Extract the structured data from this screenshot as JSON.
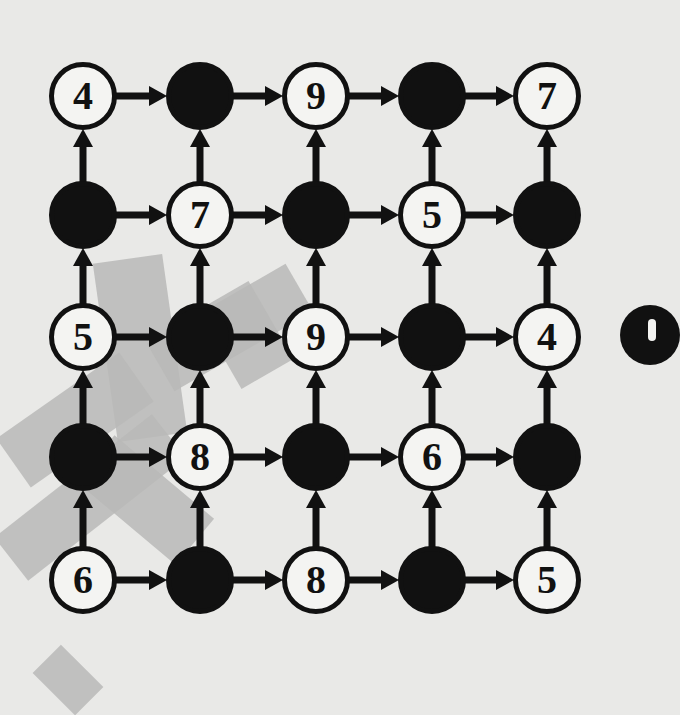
{
  "puzzle": {
    "type": "arrow-grid",
    "rows": 5,
    "cols": 5,
    "grid": [
      [
        "4",
        "",
        "9",
        "",
        "7"
      ],
      [
        "",
        "7",
        "",
        "5",
        ""
      ],
      [
        "5",
        "",
        "9",
        "",
        "4"
      ],
      [
        "",
        "8",
        "",
        "6",
        ""
      ],
      [
        "6",
        "",
        "8",
        "",
        "5"
      ]
    ],
    "cell_colors": [
      [
        "white",
        "black",
        "white",
        "black",
        "white"
      ],
      [
        "black",
        "white",
        "black",
        "white",
        "black"
      ],
      [
        "white",
        "black",
        "white",
        "black",
        "white"
      ],
      [
        "black",
        "white",
        "black",
        "white",
        "black"
      ],
      [
        "white",
        "black",
        "white",
        "black",
        "white"
      ]
    ],
    "arrow_directions": {
      "horizontal": "right",
      "vertical": "up"
    },
    "col_centers": [
      83,
      200,
      316,
      432,
      547
    ],
    "row_centers": [
      96,
      215,
      337,
      457,
      580
    ],
    "node_diameter": 68
  },
  "colors": {
    "background": "#e9e9e7",
    "ink": "#111111",
    "node_fill_white": "#f4f4f2",
    "watermark": "#b9b9b7"
  },
  "edge_artifacts": {
    "partial_node_right_edge": "black"
  }
}
